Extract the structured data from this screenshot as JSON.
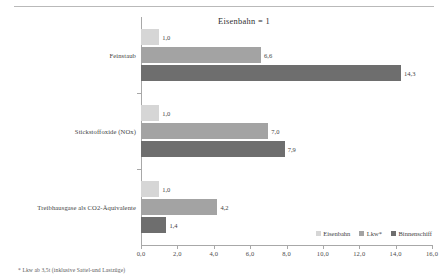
{
  "chart_data": {
    "type": "bar",
    "orientation": "horizontal",
    "title": "Eisenbahn = 1",
    "xlabel": "",
    "ylabel": "",
    "xlim": [
      0,
      16
    ],
    "xticks": [
      "0,0",
      "2,0",
      "4,0",
      "6,0",
      "8,0",
      "10,0",
      "12,0",
      "14,0",
      "16,0"
    ],
    "xtick_values": [
      0,
      2,
      4,
      6,
      8,
      10,
      12,
      14,
      16
    ],
    "grid": false,
    "legend_position": "bottom-right",
    "categories": [
      "Feinstaub",
      "Stickstoffoxide (NOx)",
      "Treibhausgase als CO2-Äquivalente"
    ],
    "series": [
      {
        "name": "Eisenbahn",
        "color": "#d6d6d6",
        "values": [
          1.0,
          1.0,
          1.0
        ],
        "labels": [
          "1,0",
          "1,0",
          "1,0"
        ]
      },
      {
        "name": "Lkw*",
        "color": "#a3a3a3",
        "values": [
          6.6,
          7.0,
          4.2
        ],
        "labels": [
          "6,6",
          "7,0",
          "4,2"
        ]
      },
      {
        "name": "Binnenschiff",
        "color": "#6e6e6e",
        "values": [
          14.3,
          7.9,
          1.4
        ],
        "labels": [
          "14,3",
          "7,9",
          "1,4"
        ]
      }
    ],
    "footnote": "* Lkw ab 3,5t (inklusive Sattel-und Lastzüge)"
  }
}
